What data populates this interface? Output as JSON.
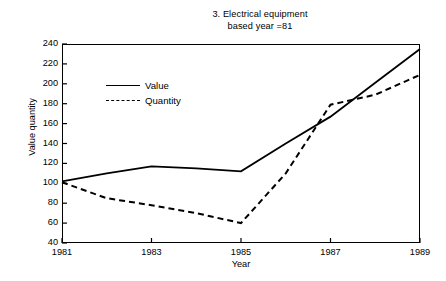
{
  "chart_data": {
    "type": "line",
    "title": "3. Electrical equipment",
    "subtitle": "based year =81",
    "xlabel": "Year",
    "ylabel": "Value quantity",
    "xlim": [
      1981,
      1989
    ],
    "ylim": [
      40,
      240
    ],
    "yticks": [
      40,
      60,
      80,
      100,
      120,
      140,
      160,
      180,
      200,
      220,
      240
    ],
    "xticks": [
      1981,
      1983,
      1985,
      1987,
      1989
    ],
    "xtick_labels": [
      "1981",
      "1983",
      "1985",
      "1987",
      "1989"
    ],
    "ytick_labels": [
      "40",
      "60",
      "80",
      "100",
      "120",
      "140",
      "160",
      "180",
      "200",
      "220",
      "240"
    ],
    "grid": false,
    "legend_position": "upper-left-inside",
    "x": [
      1981,
      1982,
      1983,
      1984,
      1985,
      1986,
      1987,
      1988,
      1989
    ],
    "series": [
      {
        "name": "Value",
        "style": "solid",
        "color": "#000000",
        "values": [
          102,
          110,
          117,
          115,
          112,
          140,
          167,
          201,
          235
        ]
      },
      {
        "name": "Quantity",
        "style": "dashed",
        "color": "#000000",
        "values": [
          101,
          85,
          78,
          70,
          60,
          110,
          179,
          189,
          209
        ]
      }
    ]
  },
  "legend": {
    "items": [
      {
        "label": "Value",
        "style": "solid"
      },
      {
        "label": "Quantity",
        "style": "dashed"
      }
    ]
  }
}
